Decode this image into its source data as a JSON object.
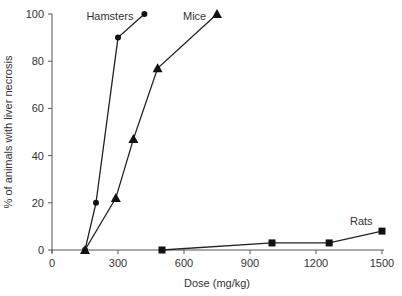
{
  "chart_data": {
    "type": "line",
    "title": "",
    "xlabel": "Dose (mg/kg)",
    "ylabel": "% of animals with liver necrosis",
    "xlim": [
      0,
      1500
    ],
    "ylim": [
      0,
      100
    ],
    "xticks": [
      0,
      300,
      600,
      900,
      1200,
      1500
    ],
    "yticks": [
      0,
      20,
      40,
      60,
      80,
      100
    ],
    "grid": false,
    "legend": "inline labels",
    "series": [
      {
        "name": "Hamsters",
        "marker": "circle",
        "x": [
          150,
          200,
          300,
          420
        ],
        "y": [
          0,
          20,
          90,
          100
        ]
      },
      {
        "name": "Mice",
        "marker": "triangle",
        "x": [
          150,
          290,
          370,
          480,
          750
        ],
        "y": [
          0,
          22,
          47,
          77,
          100
        ]
      },
      {
        "name": "Rats",
        "marker": "square",
        "x": [
          500,
          1000,
          1260,
          1500
        ],
        "y": [
          0,
          3,
          3,
          8
        ]
      }
    ]
  }
}
